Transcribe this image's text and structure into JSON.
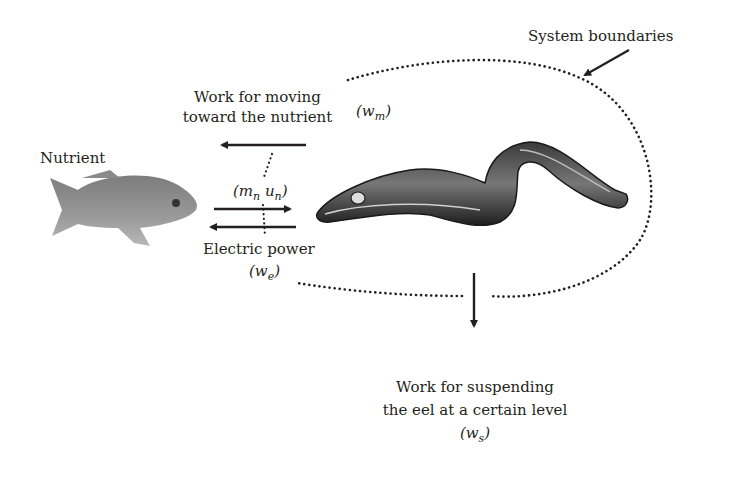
{
  "labels": {
    "system_boundaries": "System boundaries",
    "work_moving_line1": "Work for moving",
    "work_moving_line2": "toward the nutrient",
    "w_m": "(w",
    "w_m_sub": "m",
    "nutrient": "Nutrient",
    "mass_flow": "(m",
    "mass_flow_sub1": "n",
    "mass_flow_mid": " u",
    "mass_flow_sub2": "n",
    "electric_power": "Electric power",
    "w_e": "(w",
    "w_e_sub": "e",
    "work_suspend_line1": "Work for suspending",
    "work_suspend_line2": "the eel at a certain level",
    "w_s": "(w",
    "w_s_sub": "s"
  },
  "elements": {
    "fish": "nutrient-fish-illustration",
    "eel": "electric-eel-illustration",
    "boundary": "dotted-system-boundary"
  },
  "colors": {
    "ink": "#231f20",
    "fish_gray": "#8a8a8a",
    "eel_dark": "#2a2a2a"
  }
}
